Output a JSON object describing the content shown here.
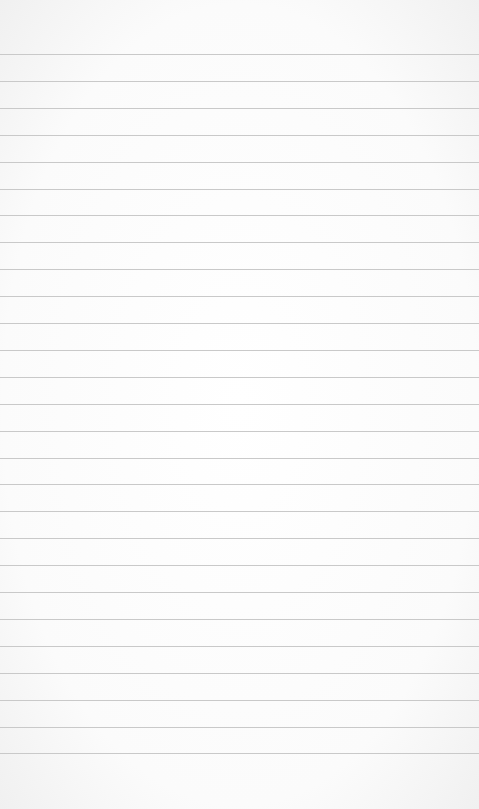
{
  "page": {
    "type": "lined-notepad",
    "background_color": "#ffffff",
    "rule_color": "#c9c9c9",
    "first_rule_y": 54,
    "rule_spacing": 26.9,
    "rule_count": 27,
    "text_content": []
  }
}
